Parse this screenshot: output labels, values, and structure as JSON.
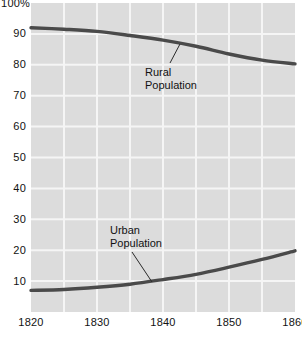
{
  "chart_data": {
    "type": "line",
    "title": "",
    "subtitle": "",
    "xlabel": "",
    "ylabel": "",
    "xlim": [
      1820,
      1860
    ],
    "ylim": [
      0,
      100
    ],
    "grid": true,
    "legend": "annotations-on-plot",
    "background_color": "#dcdcdc",
    "gridline_color": "#f5f5f5",
    "line_color": "#4a4a4a",
    "y_ticks": [
      {
        "value": 100,
        "label": "100%"
      },
      {
        "value": 90,
        "label": "90"
      },
      {
        "value": 80,
        "label": "80"
      },
      {
        "value": 70,
        "label": "70"
      },
      {
        "value": 60,
        "label": "60"
      },
      {
        "value": 50,
        "label": "50"
      },
      {
        "value": 40,
        "label": "40"
      },
      {
        "value": 30,
        "label": "30"
      },
      {
        "value": 20,
        "label": "20"
      },
      {
        "value": 10,
        "label": "10"
      }
    ],
    "x_ticks": [
      {
        "value": 1820,
        "label": "1820"
      },
      {
        "value": 1830,
        "label": "1830"
      },
      {
        "value": 1840,
        "label": "1840"
      },
      {
        "value": 1850,
        "label": "1850"
      },
      {
        "value": 1860,
        "label": "1860"
      }
    ],
    "x_gridlines": [
      1825,
      1830,
      1835,
      1840,
      1845,
      1850,
      1855
    ],
    "y_gridlines": [
      90,
      80,
      70,
      60,
      50,
      40,
      30,
      20,
      10
    ],
    "series": [
      {
        "name": "Rural Population",
        "x": [
          1820,
          1825,
          1830,
          1835,
          1840,
          1845,
          1850,
          1855,
          1860
        ],
        "values": [
          92.0,
          91.5,
          90.8,
          89.5,
          88.0,
          86.0,
          83.5,
          81.5,
          80.3
        ]
      },
      {
        "name": "Urban Population",
        "x": [
          1820,
          1825,
          1830,
          1835,
          1840,
          1845,
          1850,
          1855,
          1860
        ],
        "values": [
          7.0,
          7.3,
          8.0,
          9.0,
          10.5,
          12.2,
          14.5,
          17.0,
          19.8
        ]
      }
    ],
    "annotations": [
      {
        "id": "rural",
        "line1": "Rural",
        "line2": "Population",
        "text_x": 145,
        "text_y": 66,
        "leader_from_x": 170,
        "leader_from_y": 63,
        "leader_to_x": 180,
        "leader_to_y": 44
      },
      {
        "id": "urban",
        "line1": "Urban",
        "line2": "Population",
        "text_x": 110,
        "text_y": 224,
        "leader_from_x": 132,
        "leader_from_y": 252,
        "leader_to_x": 152,
        "leader_to_y": 282
      }
    ]
  }
}
